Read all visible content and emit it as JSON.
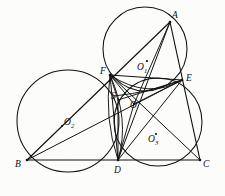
{
  "figure": {
    "background_color": "#fcfcfb",
    "stroke_color": "#111111",
    "canvas": {
      "width": 225,
      "height": 196
    }
  },
  "points": {
    "A": {
      "label": "A",
      "x": 170,
      "y": 22,
      "label_x": 172,
      "label_y": 11
    },
    "B": {
      "label": "B",
      "x": 27,
      "y": 160,
      "label_x": 15,
      "label_y": 160
    },
    "C": {
      "label": "C",
      "x": 200,
      "y": 160,
      "label_x": 203,
      "label_y": 160
    },
    "D": {
      "label": "D",
      "x": 118,
      "y": 160,
      "label_x": 114,
      "label_y": 168
    },
    "E": {
      "label": "E",
      "x": 182,
      "y": 80,
      "label_x": 186,
      "label_y": 76
    },
    "F": {
      "label": "F",
      "x": 110,
      "y": 75,
      "label_x": 101,
      "label_y": 69
    },
    "S": {
      "label": "S",
      "x": 118,
      "y": 100,
      "label_x": 112,
      "label_y": 94
    },
    "O": {
      "label": "O",
      "x": 134,
      "y": 104,
      "label_x": 131,
      "label_y": 102
    }
  },
  "centers": {
    "O1": {
      "label": "O",
      "sub": "1",
      "cx": 145,
      "cy": 49,
      "r": 42,
      "dot_x": 146,
      "dot_y": 60,
      "label_x": 137,
      "label_y": 66
    },
    "O2": {
      "label": "O",
      "sub": "2",
      "cx": 68,
      "cy": 121,
      "r": 51,
      "dot_x": 61,
      "dot_y": 125,
      "label_x": 63,
      "label_y": 121
    },
    "O3": {
      "label": "O",
      "sub": "3",
      "cx": 158,
      "cy": 122,
      "r": 44,
      "dot_x": 155,
      "dot_y": 133,
      "label_x": 148,
      "label_y": 138
    }
  },
  "circles": [
    {
      "name": "circle-O1-AFE",
      "through": [
        "A",
        "F",
        "E"
      ],
      "cx": 145,
      "cy": 49,
      "r": 42
    },
    {
      "name": "circle-O2-BDF",
      "through": [
        "B",
        "D",
        "F"
      ],
      "cx": 68,
      "cy": 121,
      "r": 51
    },
    {
      "name": "circle-O3-DEC",
      "through": [
        "D",
        "E",
        "C"
      ],
      "cx": 158,
      "cy": 122,
      "r": 44
    }
  ],
  "segments": [
    {
      "name": "side-AB",
      "from": "A",
      "to": "B"
    },
    {
      "name": "side-BC",
      "from": "B",
      "to": "C"
    },
    {
      "name": "side-CA",
      "from": "C",
      "to": "A"
    },
    {
      "name": "cevian-AD",
      "from": "A",
      "to": "D"
    },
    {
      "name": "cevian-BE",
      "from": "B",
      "to": "E"
    },
    {
      "name": "cevian-CF",
      "from": "C",
      "to": "F"
    },
    {
      "name": "chord-FE",
      "from": "F",
      "to": "E"
    },
    {
      "name": "chord-FD",
      "from": "F",
      "to": "D"
    },
    {
      "name": "chord-DE",
      "from": "D",
      "to": "E"
    },
    {
      "name": "segment-FO",
      "from": "F",
      "to": "O"
    },
    {
      "name": "segment-EO",
      "from": "E",
      "to": "O"
    },
    {
      "name": "segment-DO",
      "from": "D",
      "to": "O"
    },
    {
      "name": "segment-FS",
      "from": "F",
      "to": "S"
    },
    {
      "name": "segment-SD",
      "from": "S",
      "to": "D"
    },
    {
      "name": "segment-SE",
      "from": "S",
      "to": "E"
    },
    {
      "name": "segment-AO",
      "from": "A",
      "to": "O"
    }
  ],
  "arcs": [
    {
      "name": "lens-arc-left",
      "from": "F",
      "to": "D",
      "bulge": -9
    },
    {
      "name": "lens-arc-right",
      "from": "F",
      "to": "D",
      "bulge": 9
    },
    {
      "name": "arc-F-to-E-low",
      "from": "F",
      "to": "E",
      "bulge": 12
    },
    {
      "name": "arc-S-to-E",
      "from": "S",
      "to": "E",
      "bulge": -8
    }
  ]
}
